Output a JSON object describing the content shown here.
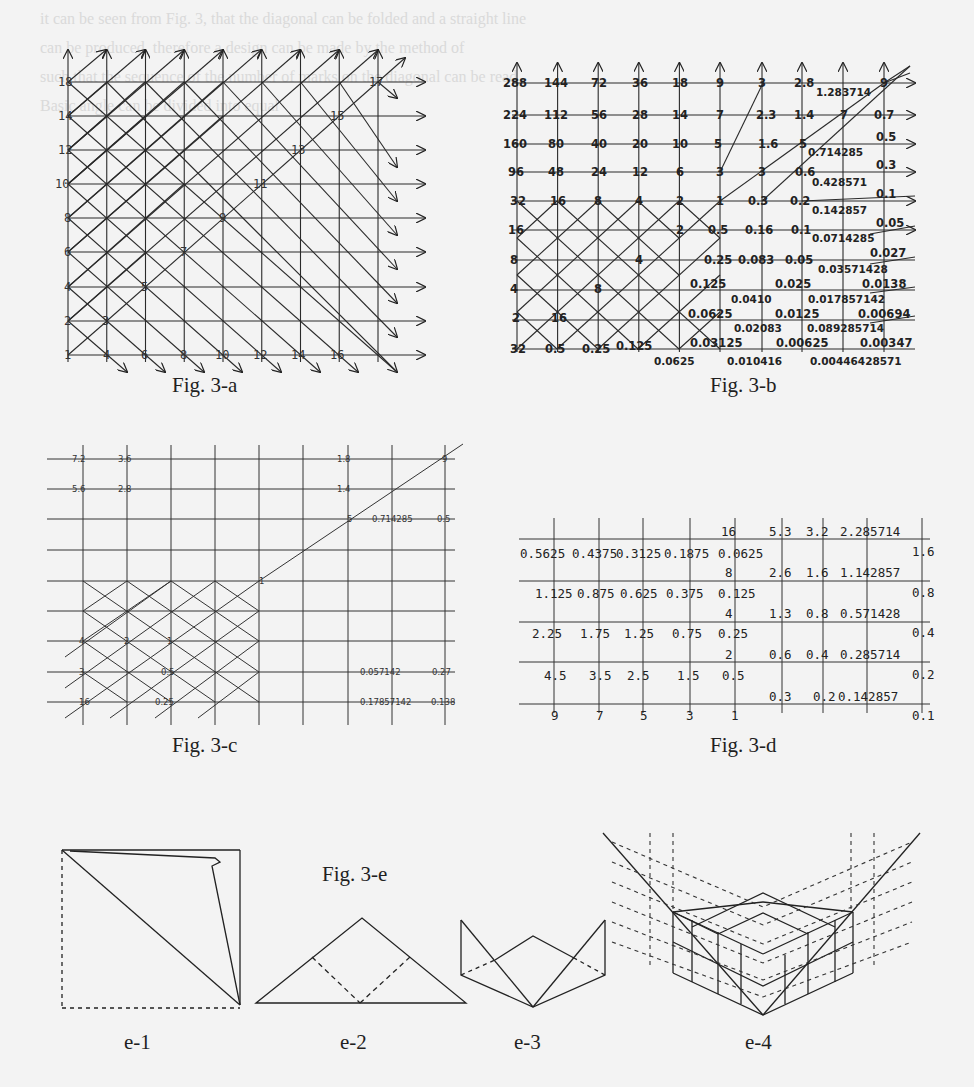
{
  "background_text": {
    "lines": [
      "it can be seen from Fig. 3, that the diagonal can be folded and a straight line",
      "can be produced, therefore a design can be made by the method of",
      "",
      "such that the sequence of the number of marks on the diagonal can be read",
      "Basic angle can be divided into equal",
      "",
      "",
      "",
      "",
      "",
      "",
      "each point is on the terminal edge",
      "some direction to 2, parallel and convergent of the side of the terminal 9",
      "yields layers b, sort of, the terminal",
      "The numbers were displayed on the base",
      "each face of the upper",
      "",
      "",
      "",
      "",
      "",
      "",
      "",
      "",
      "Based on the previous component",
      "by means of being ADD(X) and",
      "techniques of component sequencing the",
      "in the figure. The specific process"
    ]
  },
  "figures": {
    "fig_3a": {
      "caption": "Fig. 3-a",
      "left_labels": [
        "18",
        "14",
        "12",
        "10",
        "8",
        "6",
        "4",
        "2",
        "1"
      ],
      "bottom_labels": [
        "4",
        "6",
        "8",
        "10",
        "12",
        "14",
        "16"
      ],
      "diagonal_labels": [
        "3",
        "5",
        "7",
        "9",
        "11",
        "13",
        "15",
        "17"
      ]
    },
    "fig_3b": {
      "caption": "Fig. 3-b",
      "rows": [
        [
          "288",
          "144",
          "72",
          "36",
          "18",
          "9",
          "3",
          "2.8",
          "",
          "9"
        ],
        [
          "224",
          "112",
          "56",
          "28",
          "14",
          "7",
          "2.3",
          "1.4",
          "7",
          "0.7"
        ],
        [
          "160",
          "80",
          "40",
          "20",
          "10",
          "5",
          "1.6",
          "5",
          "",
          "0.5"
        ],
        [
          "96",
          "48",
          "24",
          "12",
          "6",
          "3",
          "3",
          "0.6",
          "",
          "0.3"
        ],
        [
          "32",
          "16",
          "8",
          "4",
          "2",
          "1",
          "0.3",
          "0.2",
          "",
          "0.1"
        ],
        [
          "16",
          "",
          "",
          "",
          "2",
          "0.5",
          "0.16",
          "0.1",
          "",
          "0.05"
        ],
        [
          "8",
          "",
          "",
          "4",
          "",
          "0.25",
          "0.083",
          "0.05",
          "",
          "0.027"
        ],
        [
          "4",
          "",
          "8",
          "",
          "0.125",
          "",
          "",
          "0.025",
          "",
          "0.0138"
        ],
        [
          "2",
          "16",
          "",
          "",
          "0.0625",
          "",
          "",
          "0.0125",
          "",
          "0.00694"
        ],
        [
          "32",
          "0.5",
          "0.25",
          "0.125",
          "",
          "0.03125",
          "",
          "0.00625",
          "",
          "0.00347"
        ]
      ],
      "sub_row_labels": [
        "1.283714",
        "0.714285",
        "0.428571",
        "0.142857",
        "0.0714285",
        "0.03571428",
        "0.0410",
        "0.017857142",
        "0.02083",
        "0.089285714",
        "0.0625",
        "0.010416",
        "0.00446428571"
      ]
    },
    "fig_3c": {
      "caption": "Fig. 3-c",
      "labels": {
        "r1": [
          "7.2",
          "3.6",
          "1.8",
          "9"
        ],
        "r2": [
          "5.6",
          "2.8",
          "1.4"
        ],
        "r3": [
          "5",
          "0.714285",
          "0.5"
        ],
        "r5": [
          "1"
        ],
        "r7": [
          "4",
          "2",
          "1"
        ],
        "r8": [
          "3",
          "0.5",
          "0.057142",
          "0.27"
        ],
        "r9": [
          "16",
          "0.25",
          "0.17857142",
          "0.138"
        ]
      }
    },
    "fig_3d": {
      "caption": "Fig. 3-d",
      "left_rows": [
        [
          "0.5625",
          "0.4375",
          "0.3125",
          "0.1875",
          "0.0625"
        ],
        [
          "1.125",
          "0.875",
          "0.625",
          "0.375",
          "0.125"
        ],
        [
          "2.25",
          "1.75",
          "1.25",
          "0.75",
          "0.25"
        ],
        [
          "4.5",
          "3.5",
          "2.5",
          "1.5",
          "0.5"
        ]
      ],
      "bottom_odd": [
        "9",
        "7",
        "5",
        "3",
        "1"
      ],
      "mid_column": [
        "16",
        "8",
        "4",
        "2"
      ],
      "right_rows": [
        [
          "5.3",
          "3.2",
          "2.285714"
        ],
        [
          "2.6",
          "1.6",
          "1.142857"
        ],
        [
          "1.3",
          "0.8",
          "0.571428"
        ],
        [
          "0.6",
          "0.4",
          "0.285714"
        ],
        [
          "0.3",
          "0.2",
          "0.142857"
        ]
      ],
      "far_right": [
        "1.6",
        "0.8",
        "0.4",
        "0.2",
        "0.1"
      ]
    },
    "fig_3e": {
      "caption": "Fig. 3-e",
      "subfigures": [
        "e-1",
        "e-2",
        "e-3",
        "e-4"
      ]
    }
  }
}
